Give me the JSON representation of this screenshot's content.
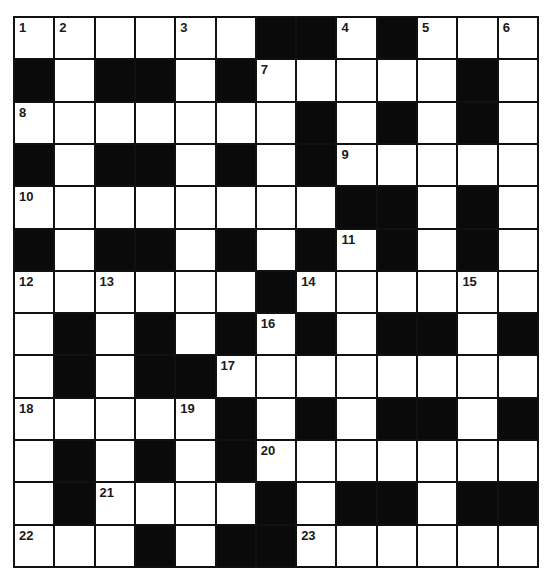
{
  "puzzle": {
    "type": "crossword",
    "rows": 13,
    "cols": 13,
    "colors": {
      "block": "#0a0a0a",
      "cell": "#ffffff",
      "border": "#111111"
    },
    "layout": [
      "......##.#...",
      "#.##.#.....#.",
      ".......#.#.#.",
      "#.##.#.#.....",
      "........##.#.",
      "#.##.#.#.#.#.",
      "......#......",
      ".#.#.#.#.##.#",
      ".#.##........",
      ".....#.#.##.#",
      ".#.#.#.......",
      ".#....#.##.##",
      "...#.##......"
    ],
    "numbers": [
      {
        "n": "1",
        "r": 0,
        "c": 0
      },
      {
        "n": "2",
        "r": 0,
        "c": 1
      },
      {
        "n": "3",
        "r": 0,
        "c": 4
      },
      {
        "n": "4",
        "r": 0,
        "c": 8
      },
      {
        "n": "5",
        "r": 0,
        "c": 10
      },
      {
        "n": "6",
        "r": 0,
        "c": 12
      },
      {
        "n": "7",
        "r": 1,
        "c": 6
      },
      {
        "n": "8",
        "r": 2,
        "c": 0
      },
      {
        "n": "9",
        "r": 3,
        "c": 8
      },
      {
        "n": "10",
        "r": 4,
        "c": 0
      },
      {
        "n": "11",
        "r": 5,
        "c": 8
      },
      {
        "n": "12",
        "r": 6,
        "c": 0
      },
      {
        "n": "13",
        "r": 6,
        "c": 2
      },
      {
        "n": "14",
        "r": 6,
        "c": 7
      },
      {
        "n": "15",
        "r": 6,
        "c": 11
      },
      {
        "n": "16",
        "r": 7,
        "c": 6
      },
      {
        "n": "17",
        "r": 8,
        "c": 5
      },
      {
        "n": "18",
        "r": 9,
        "c": 0
      },
      {
        "n": "19",
        "r": 9,
        "c": 4
      },
      {
        "n": "20",
        "r": 10,
        "c": 6
      },
      {
        "n": "21",
        "r": 11,
        "c": 2
      },
      {
        "n": "22",
        "r": 12,
        "c": 0
      },
      {
        "n": "23",
        "r": 12,
        "c": 7
      }
    ]
  }
}
